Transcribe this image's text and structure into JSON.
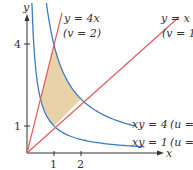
{
  "figure": {
    "axes": {
      "x_label": "x",
      "y_label": "y",
      "x_ticks": [
        "1",
        "2"
      ],
      "y_ticks": [
        "1",
        "4"
      ]
    },
    "curves": [
      {
        "id": "y-eq-x",
        "equation": "y = x",
        "param": "(v = 1)",
        "color": "#e05a5a"
      },
      {
        "id": "y-eq-4x",
        "equation": "y = 4x",
        "param": "(v = 2)",
        "color": "#e05a5a"
      },
      {
        "id": "xy-eq-4",
        "equation": "xy = 4",
        "param": "(u = 2)",
        "color": "#3a7cc4"
      },
      {
        "id": "xy-eq-1",
        "equation": "xy = 1",
        "param": "(u = 1)",
        "color": "#3a7cc4"
      }
    ],
    "region": {
      "fill": "#e8d3a8",
      "description": "region bounded by y=x, y=4x, xy=1, xy=4"
    }
  }
}
